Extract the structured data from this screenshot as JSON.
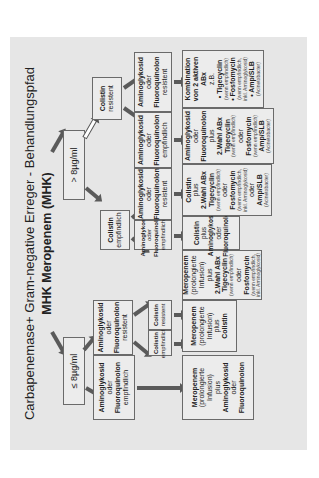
{
  "diagram": {
    "title": "Carbapenemase+ Gram-negative Erreger - Behandlungspfad",
    "subtitle": "MHK Meropenem (MHK)",
    "mic_low": "≤ 8µg/ml",
    "mic_high": "> 8µg/ml",
    "level2": {
      "amino_empf": [
        "Aminoglykosid",
        "oder",
        "Fluoroquinolon",
        "empfindlich"
      ],
      "amino_resist": [
        "Aminoglykosid",
        "oder",
        "Fluoroquinolon",
        "resistent"
      ],
      "colistin_empf": [
        "Colistin",
        "empfindlich"
      ],
      "colistin_resist": [
        "Colistin",
        "resistent"
      ]
    },
    "level3": {
      "colistin_empf": [
        "Colistin",
        "empfindlich"
      ],
      "colistin_resist": [
        "Colistin",
        "resistent"
      ],
      "a1": [
        "Aminoglykosid",
        "oder",
        "Fluoroquinolon",
        "empfindlich"
      ],
      "a2": [
        "Aminoglykosid",
        "oder",
        "Fluoroquinolon",
        "resistent"
      ],
      "a3": [
        "Aminoglykosid",
        "oder",
        "Fluoroquinolon",
        "empfindlich"
      ],
      "a4": [
        "Aminoglykosid",
        "oder",
        "Fluoroquinolon",
        "resistent"
      ]
    },
    "level4": {
      "t1": [
        "Meropenem",
        "(prolongierte",
        "Infusion)",
        "plus",
        "Aminoglykosid",
        "oder",
        "Fluoroquinolon"
      ],
      "t2": [
        "Meropenem",
        "(prolongierte",
        "Infusion)",
        "plus",
        "Colistin"
      ],
      "t3": [
        "Meropenem",
        "(prolongierte",
        "Infusion)",
        "plus",
        "2.Wahl ABx",
        "Tigecyclin",
        "(wenn empfindlich)",
        "oder",
        "Fosfomycin",
        "(wenn empfindlich,",
        "inkl. Aminoglykosid)"
      ],
      "t4": [
        "Colistin",
        "plus",
        "Aminoglykosid",
        "oder",
        "Fluoroquinolon"
      ],
      "t5": [
        "Colistin",
        "plus",
        "2.Wahl ABx",
        "Tigecyclin",
        "(wenn empfindlich)",
        "oder",
        "Fosfomycin",
        "(wenn empfindlich,",
        "inkl. Aminoglykosid)",
        "oder",
        "Amp/SLB",
        "(Acinetobacter)"
      ],
      "t6": [
        "Aminoglykosid",
        "oder",
        "Fluoroquinolon",
        "plus",
        "2.Wahl ABx",
        "Tigecyclin",
        "(wenn empfindlich)",
        "oder",
        "Fosfomycin",
        "(wenn empfindlich)",
        "Amp/SLB",
        "(Acinetobacter)"
      ],
      "t7": [
        "Kombination",
        "von 2 aktiven",
        "ABx",
        "z.B.",
        "• Tigecyclin",
        "(wenn empfindlich)",
        "• Fosfomycin",
        "(wenn empfindlich,",
        "inkl. Aminoglykosid)",
        "• Amp/SLB",
        "(Acinetobacter)"
      ]
    }
  }
}
